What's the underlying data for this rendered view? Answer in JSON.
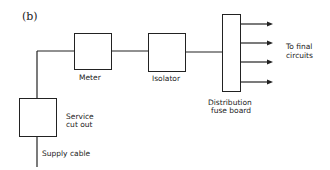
{
  "figure_label": "(b)",
  "nodes": {
    "meter": {
      "label": "Meter"
    },
    "isolator": {
      "label": "Isolator"
    },
    "distribution": {
      "label_line1": "Distribution",
      "label_line2": "fuse board"
    },
    "service_cutout": {
      "label_line1": "Service",
      "label_line2": "cut out"
    }
  },
  "supply_label": "Supply cable",
  "outputs": {
    "label_line1": "To final",
    "label_line2": "circuits",
    "count": 4
  },
  "colors": {
    "line": "#222222",
    "background": "#ffffff"
  }
}
